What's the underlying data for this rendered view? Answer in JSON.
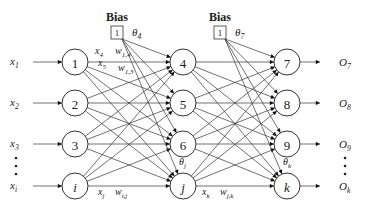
{
  "diagram": {
    "type": "feedforward-neural-network",
    "bias_blocks": [
      {
        "title": "Bias",
        "value": "1",
        "theta": "θ",
        "theta_sub": "4",
        "x": 117,
        "y": 33
      },
      {
        "title": "Bias",
        "value": "1",
        "theta": "θ",
        "theta_sub": "7",
        "x": 220,
        "y": 33
      }
    ],
    "layers": [
      {
        "name": "input",
        "x": 75,
        "nodes": [
          {
            "label": "1",
            "y": 62,
            "input_label": "x",
            "input_sub": "1"
          },
          {
            "label": "2",
            "y": 103,
            "input_label": "x",
            "input_sub": "2"
          },
          {
            "label": "3",
            "y": 144,
            "input_label": "x",
            "input_sub": "3"
          },
          {
            "label": "i",
            "y": 186,
            "input_label": "x",
            "input_sub": "i",
            "italic": true
          }
        ]
      },
      {
        "name": "hidden",
        "x": 183,
        "nodes": [
          {
            "label": "4",
            "y": 62
          },
          {
            "label": "5",
            "y": 103
          },
          {
            "label": "6",
            "y": 144
          },
          {
            "label": "j",
            "y": 186,
            "italic": true
          }
        ]
      },
      {
        "name": "output",
        "x": 287,
        "nodes": [
          {
            "label": "7",
            "y": 62,
            "output_label": "O",
            "output_sub": "7"
          },
          {
            "label": "8",
            "y": 103,
            "output_label": "O",
            "output_sub": "8"
          },
          {
            "label": "9",
            "y": 144,
            "output_label": "O",
            "output_sub": "9"
          },
          {
            "label": "k",
            "y": 186,
            "output_label": "O",
            "output_sub": "k",
            "italic": true
          }
        ]
      }
    ],
    "edge_labels": [
      {
        "text": "x",
        "sub": "4",
        "x": 95,
        "y": 54
      },
      {
        "text": "w",
        "sub": "1,4",
        "x": 115,
        "y": 54
      },
      {
        "text": "x",
        "sub": "5",
        "x": 98,
        "y": 66
      },
      {
        "text": "w",
        "sub": "1,3",
        "x": 118,
        "y": 71
      },
      {
        "text": "x",
        "sub": "j",
        "x": 98,
        "y": 195
      },
      {
        "text": "w",
        "sub": "i,j",
        "x": 115,
        "y": 195
      },
      {
        "text": "x",
        "sub": "k",
        "x": 202,
        "y": 195
      },
      {
        "text": "w",
        "sub": "j,k",
        "x": 220,
        "y": 195
      }
    ],
    "theta_labels": [
      {
        "text": "θ",
        "sub": "j",
        "x": 183,
        "y": 165
      },
      {
        "text": "θ",
        "sub": "k",
        "x": 287,
        "y": 165
      }
    ],
    "ellipsis": "⋮"
  }
}
